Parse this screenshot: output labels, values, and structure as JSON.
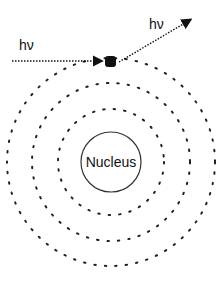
{
  "labels": {
    "incoming_photon": "hν",
    "outgoing_photon": "hν",
    "nucleus": "Nucleus"
  },
  "diagram": {
    "center": [
      111,
      162
    ],
    "nucleus_radius": 30,
    "orbit_radii": [
      53,
      79,
      104
    ],
    "electron": [
      110,
      61
    ],
    "incoming_arrow": {
      "from": [
        12,
        61
      ],
      "to": [
        103,
        61
      ]
    },
    "outgoing_arrow": {
      "from": [
        118,
        63
      ],
      "to": [
        194,
        17
      ]
    },
    "colors": {
      "ink": "#111111",
      "background": "#ffffff"
    }
  }
}
